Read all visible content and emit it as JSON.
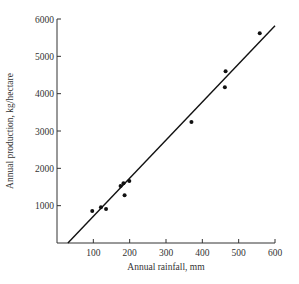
{
  "chart_data": {
    "type": "scatter",
    "title": "",
    "xlabel": "Annual rainfall, mm",
    "ylabel": "Annual production, kg/hectare",
    "xlim": [
      0,
      600
    ],
    "ylim": [
      0,
      6000
    ],
    "x_ticks": [
      100,
      200,
      300,
      400,
      500,
      600
    ],
    "y_ticks": [
      1000,
      2000,
      3000,
      4000,
      5000,
      6000
    ],
    "x_tick_labels": [
      "100",
      "200",
      "300",
      "400",
      "500",
      "600"
    ],
    "y_tick_labels": [
      "1000",
      "2000",
      "3000",
      "4000",
      "5000",
      "6000"
    ],
    "grid": false,
    "legend": null,
    "series": [
      {
        "name": "observations",
        "type": "scatter",
        "points": [
          {
            "x": 97,
            "y": 855
          },
          {
            "x": 121,
            "y": 960
          },
          {
            "x": 135,
            "y": 910
          },
          {
            "x": 175,
            "y": 1525
          },
          {
            "x": 183,
            "y": 1600
          },
          {
            "x": 186,
            "y": 1280
          },
          {
            "x": 199,
            "y": 1660
          },
          {
            "x": 370,
            "y": 3240
          },
          {
            "x": 462,
            "y": 4170
          },
          {
            "x": 464,
            "y": 4600
          },
          {
            "x": 558,
            "y": 5620
          }
        ]
      },
      {
        "name": "fit line",
        "type": "line",
        "points": [
          {
            "x": 30,
            "y": 0
          },
          {
            "x": 600,
            "y": 5820
          }
        ]
      }
    ]
  }
}
